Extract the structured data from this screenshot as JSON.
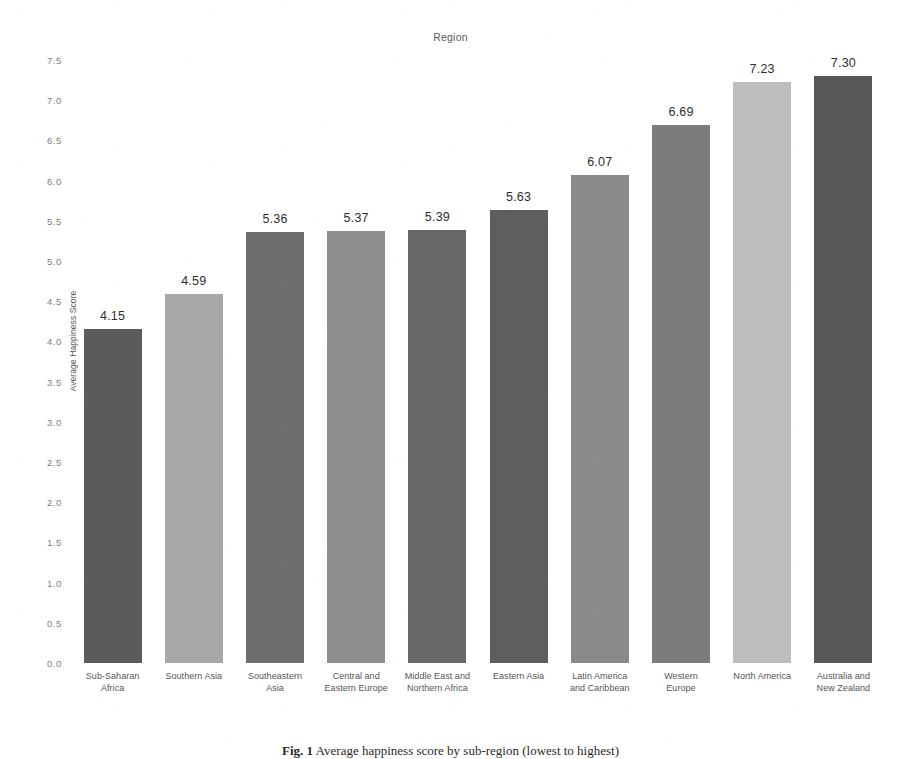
{
  "chart_data": {
    "type": "bar",
    "title": "Region",
    "xlabel": "Region",
    "ylabel": "Average Happiness Score",
    "ylim": [
      0.0,
      7.5
    ],
    "grid": false,
    "legend": "none",
    "categories": [
      "Sub-Saharan Africa",
      "Southern Asia",
      "Southeastern Asia",
      "Central and Eastern Europe",
      "Middle East and Northern Africa",
      "Eastern Asia",
      "Latin America and Caribbean",
      "Western Europe",
      "North America",
      "Australia and New Zealand"
    ],
    "category_lines": [
      [
        "Sub-Saharan",
        "Africa"
      ],
      [
        "Southern Asia",
        ""
      ],
      [
        "Southeastern",
        "Asia"
      ],
      [
        "Central and",
        "Eastern Europe"
      ],
      [
        "Middle East and",
        "Northern Africa"
      ],
      [
        "Eastern Asia",
        ""
      ],
      [
        "Latin America",
        "and Caribbean"
      ],
      [
        "Western",
        "Europe"
      ],
      [
        "North America",
        ""
      ],
      [
        "Australia and",
        "New Zealand"
      ]
    ],
    "values": [
      4.15,
      4.59,
      5.36,
      5.37,
      5.39,
      5.63,
      6.07,
      6.69,
      7.23,
      7.3
    ],
    "value_labels": [
      "4.15",
      "4.59",
      "5.36",
      "5.37",
      "5.39",
      "5.63",
      "6.07",
      "6.69",
      "7.23",
      "7.30"
    ],
    "bar_colors": [
      "#5b5b5b",
      "#a8a8a8",
      "#6e6e6e",
      "#8e8e8e",
      "#686868",
      "#5e5e5e",
      "#8a8a8a",
      "#7c7c7c",
      "#bdbdbd",
      "#575757"
    ],
    "yticks": [
      "7.5",
      "7.0",
      "6.5",
      "6.0",
      "5.5",
      "5.0",
      "4.5",
      "4.0",
      "3.5",
      "3.0",
      "2.5",
      "2.0",
      "1.5",
      "1.0",
      "0.5",
      "0.0"
    ],
    "ytick_values": [
      7.5,
      7.0,
      6.5,
      6.0,
      5.5,
      5.0,
      4.5,
      4.0,
      3.5,
      3.0,
      2.5,
      2.0,
      1.5,
      1.0,
      0.5,
      0.0
    ]
  },
  "caption": {
    "label": "Fig. 1",
    "text": "Average happiness score by sub-region (lowest to highest)"
  }
}
